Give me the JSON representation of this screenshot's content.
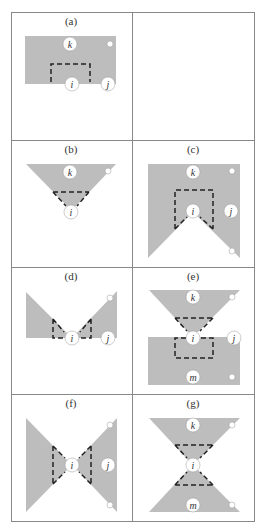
{
  "figure": {
    "colors": {
      "fill": "#bdbdbd",
      "border": "#888888",
      "dash": "#222222",
      "node_fill": "#ffffff"
    },
    "panels": [
      {
        "id": "a",
        "label": "(a)",
        "nodes": [
          "k",
          "i",
          "j"
        ]
      },
      {
        "id": "b",
        "label": "(b)",
        "nodes": [
          "k",
          "i"
        ]
      },
      {
        "id": "c",
        "label": "(c)",
        "nodes": [
          "k",
          "i",
          "j"
        ]
      },
      {
        "id": "d",
        "label": "(d)",
        "nodes": [
          "i",
          "j"
        ]
      },
      {
        "id": "e",
        "label": "(e)",
        "nodes": [
          "k",
          "i",
          "j",
          "m"
        ]
      },
      {
        "id": "f",
        "label": "(f)",
        "nodes": [
          "i",
          "j"
        ]
      },
      {
        "id": "g",
        "label": "(g)",
        "nodes": [
          "k",
          "i",
          "m"
        ]
      }
    ],
    "node_labels": {
      "k": "k",
      "i": "i",
      "j": "j",
      "m": "m"
    }
  }
}
